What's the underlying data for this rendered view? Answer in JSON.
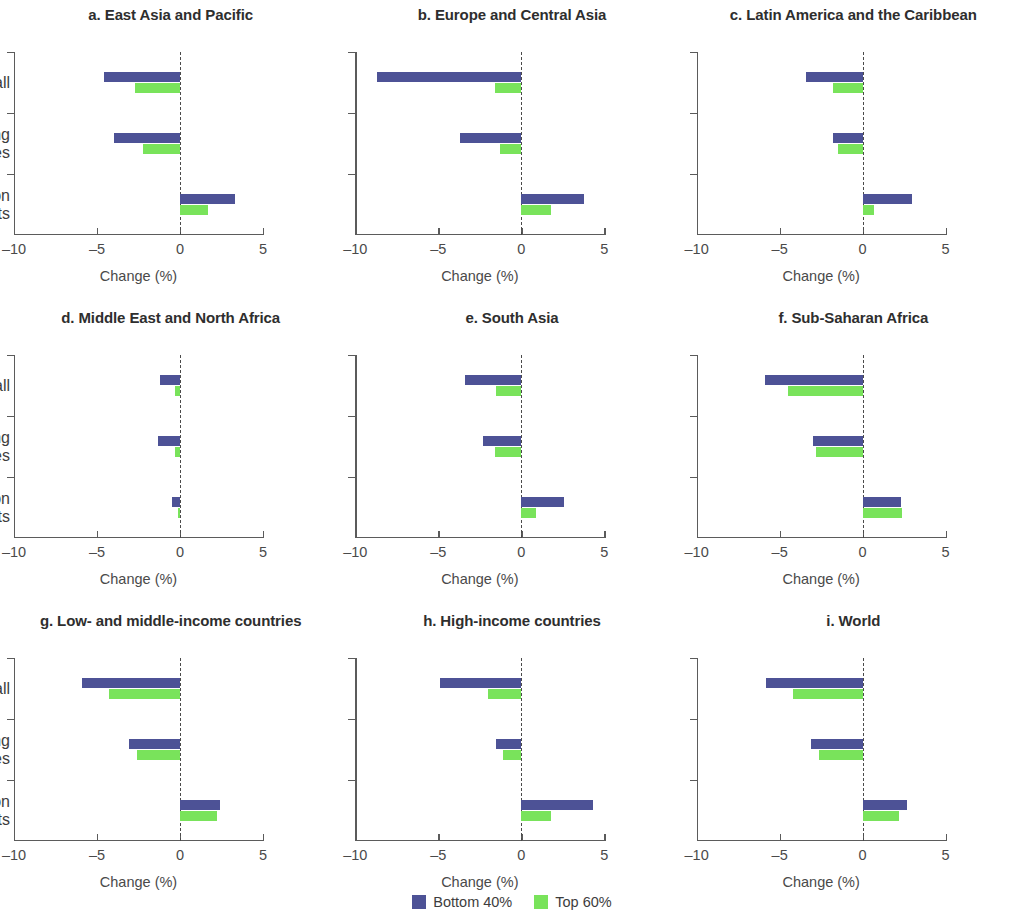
{
  "chart_data": {
    "type": "bar",
    "orientation": "horizontal",
    "title": "",
    "xlabel": "Change (%)",
    "ylabel": "",
    "xlim": [
      -10,
      5
    ],
    "xticks": [
      -10,
      -5,
      0,
      5
    ],
    "xtick_labels": [
      "–10",
      "–5",
      "0",
      "5"
    ],
    "categories": [
      "Reshoring all",
      "Reshoring leading\neconomies",
      "GVC-friendly liberalization\n+ TF imports"
    ],
    "legend": {
      "position": "bottom-center",
      "entries": [
        {
          "name": "Bottom 40%",
          "color": "#4d5296"
        },
        {
          "name": "Top 60%",
          "color": "#79e35b"
        }
      ]
    },
    "grid": false,
    "zero_reference_line": true,
    "panels": [
      {
        "id": "a",
        "title": "a. East Asia and Pacific",
        "series": [
          {
            "name": "Bottom 40%",
            "values": [
              -4.6,
              -4.0,
              3.3
            ]
          },
          {
            "name": "Top 60%",
            "values": [
              -2.7,
              -2.2,
              1.7
            ]
          }
        ]
      },
      {
        "id": "b",
        "title": "b. Europe and Central Asia",
        "series": [
          {
            "name": "Bottom 40%",
            "values": [
              -8.7,
              -3.7,
              3.8
            ]
          },
          {
            "name": "Top 60%",
            "values": [
              -1.6,
              -1.3,
              1.8
            ]
          }
        ]
      },
      {
        "id": "c",
        "title": "c. Latin America and the Caribbean",
        "series": [
          {
            "name": "Bottom 40%",
            "values": [
              -3.4,
              -1.8,
              3.0
            ]
          },
          {
            "name": "Top 60%",
            "values": [
              -1.8,
              -1.5,
              0.7
            ]
          }
        ]
      },
      {
        "id": "d",
        "title": "d. Middle East and North Africa",
        "series": [
          {
            "name": "Bottom 40%",
            "values": [
              -1.2,
              -1.3,
              -0.5
            ]
          },
          {
            "name": "Top 60%",
            "values": [
              -0.3,
              -0.3,
              -0.1
            ]
          }
        ]
      },
      {
        "id": "e",
        "title": "e. South Asia",
        "series": [
          {
            "name": "Bottom 40%",
            "values": [
              -3.4,
              -2.3,
              2.6
            ]
          },
          {
            "name": "Top 60%",
            "values": [
              -1.5,
              -1.6,
              0.9
            ]
          }
        ]
      },
      {
        "id": "f",
        "title": "f. Sub-Saharan Africa",
        "series": [
          {
            "name": "Bottom 40%",
            "values": [
              -5.9,
              -3.0,
              2.3
            ]
          },
          {
            "name": "Top 60%",
            "values": [
              -4.5,
              -2.8,
              2.4
            ]
          }
        ]
      },
      {
        "id": "g",
        "title": "g. Low- and middle-income countries",
        "series": [
          {
            "name": "Bottom 40%",
            "values": [
              -5.9,
              -3.1,
              2.4
            ]
          },
          {
            "name": "Top 60%",
            "values": [
              -4.3,
              -2.6,
              2.2
            ]
          }
        ]
      },
      {
        "id": "h",
        "title": "h. High-income countries",
        "series": [
          {
            "name": "Bottom 40%",
            "values": [
              -4.9,
              -1.5,
              4.3
            ]
          },
          {
            "name": "Top 60%",
            "values": [
              -2.0,
              -1.1,
              1.8
            ]
          }
        ]
      },
      {
        "id": "i",
        "title": "i. World",
        "series": [
          {
            "name": "Bottom 40%",
            "values": [
              -5.8,
              -3.1,
              2.7
            ]
          },
          {
            "name": "Top 60%",
            "values": [
              -4.2,
              -2.6,
              2.2
            ]
          }
        ]
      }
    ]
  }
}
